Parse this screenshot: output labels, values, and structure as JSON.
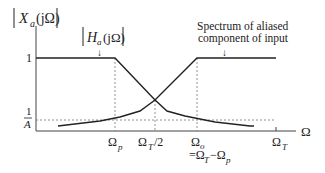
{
  "diagram": {
    "y_axis_label": "|Xa(jΩ)|",
    "y_axis_label_parts": {
      "main": "X",
      "sub": "a",
      "arg": "(jΩ)"
    },
    "filter_label_parts": {
      "main": "H",
      "sub": "a",
      "arg": "(jΩ)"
    },
    "filter_label": "|Ha(jΩ)|",
    "aliased_label_line1": "Spectrum of aliased",
    "aliased_label_line2": "component of input",
    "arrow_glyph": "↓",
    "y_tick_one": "1",
    "y_tick_inv_A_num": "1",
    "y_tick_inv_A_den": "A",
    "x_axis_label": "Ω",
    "x_ticks": [
      {
        "main": "Ω",
        "sub": "p"
      },
      {
        "main": "Ω",
        "sub": "T",
        "suffix": "/2"
      },
      {
        "main": "Ω",
        "sub": "o"
      },
      {
        "main": "Ω",
        "sub": "T"
      }
    ],
    "omega_o_note": "=ΩT − Ωp",
    "omega_o_note_parts": {
      "eq": "=Ω",
      "sub1": "T",
      "mid": "−Ω",
      "sub2": "p"
    },
    "colors": {
      "line": "#222222",
      "dashed": "#777777"
    }
  }
}
